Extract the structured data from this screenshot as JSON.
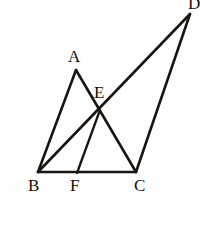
{
  "figure": {
    "background_color": "#fefefe",
    "stroke_color": "#1a1410",
    "label_color": "#14100d",
    "width": 216,
    "height": 225
  },
  "points": {
    "A": {
      "label": "A",
      "x": 76,
      "y": 70,
      "label_x": 68,
      "label_y": 48
    },
    "B": {
      "label": "B",
      "x": 38,
      "y": 172,
      "label_x": 28,
      "label_y": 177
    },
    "C": {
      "label": "C",
      "x": 136,
      "y": 172,
      "label_x": 134,
      "label_y": 177
    },
    "D": {
      "label": "D",
      "x": 190,
      "y": 14,
      "label_x": 188,
      "label_y": -5
    },
    "E": {
      "label": "E",
      "x": 100,
      "y": 110,
      "label_x": 94,
      "label_y": 84
    },
    "F": {
      "label": "F",
      "x": 77,
      "y": 173,
      "label_x": 70,
      "label_y": 177
    }
  },
  "segments": [
    {
      "name": "segment-BA",
      "from": "B",
      "to": "A"
    },
    {
      "name": "segment-AC",
      "from": "A",
      "to": "C"
    },
    {
      "name": "segment-BD",
      "from": "B",
      "to": "D"
    },
    {
      "name": "segment-BC",
      "from": "B",
      "to": "C"
    },
    {
      "name": "segment-CD",
      "from": "C",
      "to": "D"
    },
    {
      "name": "segment-EF",
      "from": "E",
      "to": "F"
    }
  ]
}
